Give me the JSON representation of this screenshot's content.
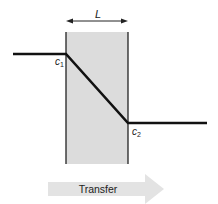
{
  "diagram": {
    "type": "concentration-profile-across-membrane",
    "membrane": {
      "fill_color": "#dcdcdc",
      "border_color": "#222222",
      "thickness_label": "L"
    },
    "profile": {
      "line_color": "#111111",
      "left_concentration_label": "c",
      "left_concentration_subscript": "1",
      "right_concentration_label": "c",
      "right_concentration_subscript": "2"
    },
    "transfer_arrow": {
      "label": "Transfer",
      "fill_color": "#e3e3e3",
      "direction": "right"
    }
  }
}
